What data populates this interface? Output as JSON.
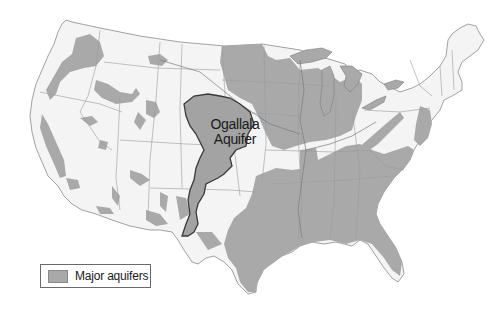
{
  "map": {
    "title": "Major aquifers of the contiguous United States",
    "region": "Contiguous United States",
    "highlighted_feature": {
      "label_line1": "Ogallala",
      "label_line2": "Aquifer"
    },
    "legend": {
      "items": [
        {
          "label": "Major aquifers",
          "color": "#a9a9a9"
        }
      ]
    },
    "colors": {
      "land": "#f4f4f4",
      "aquifer": "#a9a9a9",
      "ogallala_outline": "#3a3a3a",
      "borders": "#9a9a9a",
      "background": "#ffffff"
    }
  }
}
